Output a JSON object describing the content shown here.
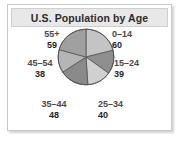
{
  "figure": {
    "title": "U.S. Population by Age"
  },
  "chart_data": {
    "type": "pie",
    "title": "U.S. Population by Age",
    "xlabel": "",
    "ylabel": "",
    "legend_position": "outside-labels",
    "grid": false,
    "categories": [
      "0–14",
      "15–24",
      "25–34",
      "35–44",
      "45–54",
      "55+"
    ],
    "values": [
      60,
      39,
      40,
      48,
      38,
      59
    ],
    "total": 284,
    "slices": [
      {
        "label": "0–14",
        "value": 60,
        "color": "#c4c4c4",
        "start_deg": 0,
        "sweep_deg": 76.06
      },
      {
        "label": "15–24",
        "value": 39,
        "color": "#8f8f8f",
        "start_deg": 76.06,
        "sweep_deg": 49.44
      },
      {
        "label": "25–34",
        "value": 40,
        "color": "#d0d0d0",
        "start_deg": 125.5,
        "sweep_deg": 50.7
      },
      {
        "label": "35–44",
        "value": 48,
        "color": "#8a8a8a",
        "start_deg": 176.2,
        "sweep_deg": 60.85
      },
      {
        "label": "45–54",
        "value": 38,
        "color": "#b5b5b5",
        "start_deg": 237.0,
        "sweep_deg": 48.17
      },
      {
        "label": "55+",
        "value": 59,
        "color": "#a0a0a0",
        "start_deg": 285.2,
        "sweep_deg": 74.79
      }
    ]
  },
  "labels": {
    "age_0_14": {
      "category": "0–14",
      "value": "60"
    },
    "age_15_24": {
      "category": "15–24",
      "value": "39"
    },
    "age_25_34": {
      "category": "25–34",
      "value": "40"
    },
    "age_35_44": {
      "category": "35–44",
      "value": "48"
    },
    "age_45_54": {
      "category": "45–54",
      "value": "38"
    },
    "age_55_up": {
      "category": "55+",
      "value": "59"
    }
  },
  "colors": {
    "outline": "#555555",
    "frame_border": "#c9c9c9",
    "title_band": "#e8e8e8",
    "title_text": "#2b2b2b"
  }
}
